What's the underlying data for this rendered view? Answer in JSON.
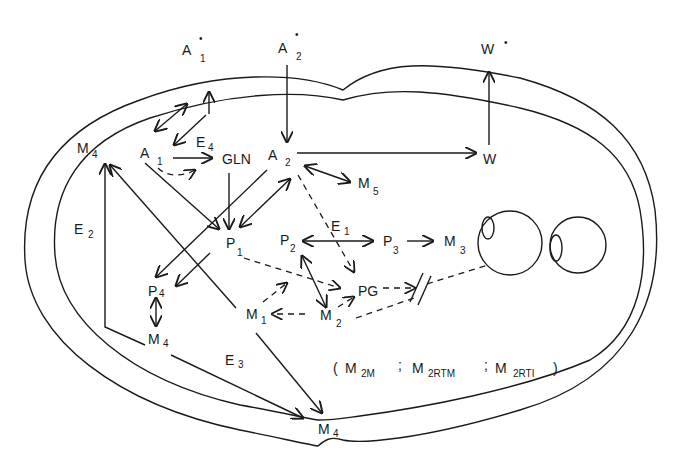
{
  "diagram": {
    "type": "compartmental-flow-diagram",
    "external_nodes": [
      {
        "id": "A1*",
        "base": "A",
        "sub": "1",
        "sup": "•"
      },
      {
        "id": "A2*",
        "base": "A",
        "sub": "2",
        "sup": "•"
      },
      {
        "id": "W*",
        "base": "W",
        "sub": "",
        "sup": "•"
      }
    ],
    "nodes": [
      {
        "id": "M4_top",
        "base": "M",
        "sub": "4"
      },
      {
        "id": "A1",
        "base": "A",
        "sub": "1"
      },
      {
        "id": "GLN",
        "base": "GLN",
        "sub": ""
      },
      {
        "id": "A2",
        "base": "A",
        "sub": "2"
      },
      {
        "id": "W",
        "base": "W",
        "sub": ""
      },
      {
        "id": "M5",
        "base": "M",
        "sub": "5"
      },
      {
        "id": "E1",
        "base": "E",
        "sub": "1"
      },
      {
        "id": "E2",
        "base": "E",
        "sub": "2"
      },
      {
        "id": "E3",
        "base": "E",
        "sub": "3"
      },
      {
        "id": "E4",
        "base": "E",
        "sub": "4"
      },
      {
        "id": "P1",
        "base": "P",
        "sub": "1"
      },
      {
        "id": "P2",
        "base": "P",
        "sub": "2"
      },
      {
        "id": "P3",
        "base": "P",
        "sub": "3"
      },
      {
        "id": "M3",
        "base": "M",
        "sub": "3"
      },
      {
        "id": "P4",
        "base": "P",
        "sub": "4"
      },
      {
        "id": "PG",
        "base": "PG",
        "sub": ""
      },
      {
        "id": "M1",
        "base": "M",
        "sub": "1"
      },
      {
        "id": "M2",
        "base": "M",
        "sub": "2"
      },
      {
        "id": "M4_mid",
        "base": "M",
        "sub": "4"
      },
      {
        "id": "M4_bottom",
        "base": "M",
        "sub": "4"
      }
    ],
    "legend": {
      "open": "(",
      "items": [
        {
          "base": "M",
          "sub": "2M"
        },
        {
          "base": "M",
          "sub": "2RTM"
        },
        {
          "base": "M",
          "sub": "2RTI"
        }
      ],
      "separator": ";",
      "close": ")"
    },
    "edges": [
      {
        "from": "A2*",
        "to": "A2",
        "style": "solid"
      },
      {
        "from": "W",
        "to": "W*",
        "style": "solid"
      },
      {
        "from": "A2",
        "to": "W",
        "style": "solid"
      },
      {
        "from": "A1",
        "to": "GLN",
        "style": "solid"
      },
      {
        "from": "A1",
        "to": "GLN",
        "style": "dashed"
      },
      {
        "from": "A2",
        "to": "M5",
        "style": "solid",
        "bidirectional": true
      },
      {
        "from": "GLN",
        "to": "P1",
        "style": "solid"
      },
      {
        "from": "A1",
        "to": "P1",
        "style": "solid"
      },
      {
        "from": "P1",
        "to": "A2",
        "style": "solid",
        "bidirectional": true
      },
      {
        "from": "A2",
        "to": "P4",
        "style": "solid"
      },
      {
        "from": "P1",
        "to": "P4",
        "style": "solid"
      },
      {
        "from": "P2",
        "to": "P3",
        "style": "solid",
        "bidirectional": true
      },
      {
        "from": "P3",
        "to": "M3",
        "style": "solid"
      },
      {
        "from": "P2",
        "to": "M2",
        "style": "solid",
        "bidirectional": true
      },
      {
        "from": "A2",
        "to": "PG",
        "style": "dashed"
      },
      {
        "from": "P1",
        "to": "PG",
        "style": "dashed"
      },
      {
        "from": "M2",
        "to": "PG",
        "style": "dashed"
      },
      {
        "from": "M2",
        "to": "M1",
        "style": "dashed"
      },
      {
        "from": "M1",
        "to": "P1",
        "style": "dashed"
      },
      {
        "from": "PG",
        "to": "M3",
        "style": "dashed",
        "blocked": true
      },
      {
        "from": "M2",
        "to": "M3",
        "style": "dashed"
      },
      {
        "from": "P4",
        "to": "M4_mid",
        "style": "solid",
        "bidirectional": true
      },
      {
        "from": "M4_mid",
        "to": "M4_top",
        "style": "solid"
      },
      {
        "from": "M1",
        "to": "M4_top",
        "style": "solid"
      },
      {
        "from": "M4_mid",
        "to": "M4_bottom",
        "style": "solid"
      },
      {
        "from": "M1",
        "to": "M4_bottom",
        "style": "solid"
      },
      {
        "from": "A1",
        "to": "A1*",
        "style": "solid",
        "bidirectional": true
      }
    ]
  }
}
